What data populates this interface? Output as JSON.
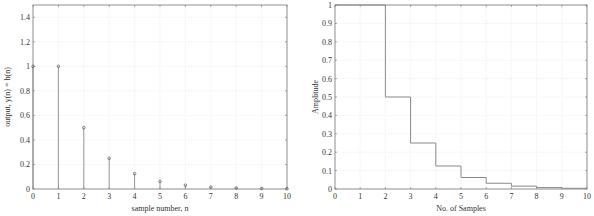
{
  "chart_data": [
    {
      "type": "stem",
      "title": "",
      "xlabel": "sample number, n",
      "ylabel": "output, y(n) = h(n)",
      "x": [
        0,
        1,
        2,
        3,
        4,
        5,
        6,
        7,
        8,
        9,
        10
      ],
      "values": [
        1,
        1,
        0.5,
        0.25,
        0.125,
        0.0625,
        0.03125,
        0.015625,
        0.0078125,
        0.00390625,
        0.001953125
      ],
      "xlim": [
        0,
        10
      ],
      "ylim": [
        0,
        1.5
      ],
      "xticks": [
        "0",
        "1",
        "2",
        "3",
        "4",
        "5",
        "6",
        "7",
        "8",
        "9",
        "10"
      ],
      "yticks": [
        "0",
        "0.2",
        "0.4",
        "0.6",
        "0.8",
        "1",
        "1.2",
        "1.4"
      ],
      "grid": true
    },
    {
      "type": "line",
      "style": "stairs",
      "title": "",
      "xlabel": "No. of Samples",
      "ylabel": "Amplitude",
      "x": [
        0,
        1,
        2,
        3,
        4,
        5,
        6,
        7,
        8,
        9,
        10
      ],
      "values": [
        1,
        1,
        0.5,
        0.25,
        0.125,
        0.0625,
        0.03125,
        0.015625,
        0.0078125,
        0.00390625,
        0.001953125
      ],
      "xlim": [
        0,
        10
      ],
      "ylim": [
        0,
        1
      ],
      "xticks": [
        "0",
        "1",
        "2",
        "3",
        "4",
        "5",
        "6",
        "7",
        "8",
        "9",
        "10"
      ],
      "yticks": [
        "0",
        "0.1",
        "0.2",
        "0.3",
        "0.4",
        "0.5",
        "0.6",
        "0.7",
        "0.8",
        "0.9",
        "1"
      ],
      "grid": true
    }
  ],
  "colors": {
    "line": "#8a8a8a",
    "grid": "#e6e6e6",
    "axis": "#777777"
  }
}
